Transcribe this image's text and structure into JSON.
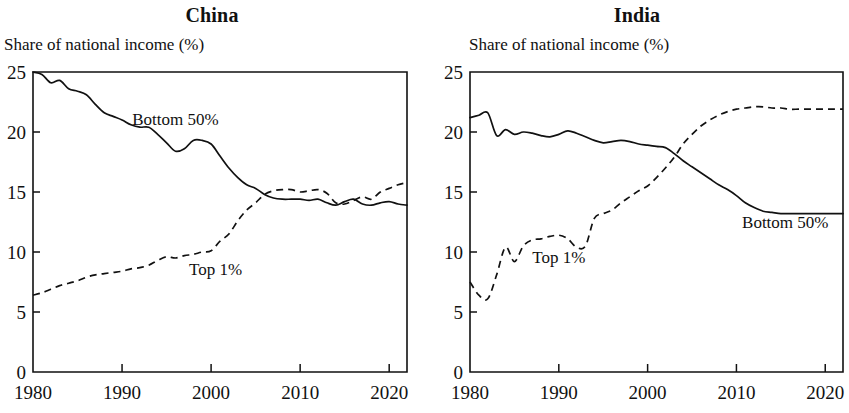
{
  "figure": {
    "axis_caption": "Share of national income (%)",
    "ink_color": "#111111",
    "background_color": "#ffffff"
  },
  "panels": [
    {
      "key": "china",
      "title": "China",
      "axis_caption": "Share of national income (%)",
      "bottom50_label": "Bottom 50%",
      "top1_label": "Top 1%"
    },
    {
      "key": "india",
      "title": "India",
      "axis_caption": "Share of national income (%)",
      "bottom50_label": "Bottom 50%",
      "top1_label": "Top 1%"
    }
  ],
  "axes": {
    "y_ticks": [
      "0",
      "5",
      "10",
      "15",
      "20",
      "25"
    ],
    "x_ticks": [
      "1980",
      "1990",
      "2000",
      "2010",
      "2020"
    ]
  },
  "chart_data": [
    {
      "type": "line",
      "title": "China",
      "xlabel": "",
      "ylabel": "Share of national income (%)",
      "xlim": [
        1980,
        2022
      ],
      "ylim": [
        0,
        25
      ],
      "y_ticks": [
        0,
        5,
        10,
        15,
        20,
        25
      ],
      "x_ticks": [
        1980,
        1990,
        2000,
        2010,
        2020
      ],
      "grid": false,
      "legend": "inline annotations",
      "x": [
        1980,
        1981,
        1982,
        1983,
        1984,
        1985,
        1986,
        1987,
        1988,
        1989,
        1990,
        1991,
        1992,
        1993,
        1994,
        1995,
        1996,
        1997,
        1998,
        1999,
        2000,
        2001,
        2002,
        2003,
        2004,
        2005,
        2006,
        2007,
        2008,
        2009,
        2010,
        2011,
        2012,
        2013,
        2014,
        2015,
        2016,
        2017,
        2018,
        2019,
        2020,
        2021,
        2022
      ],
      "series": [
        {
          "name": "Bottom 50%",
          "style": "solid",
          "values": [
            25.0,
            24.8,
            24.1,
            24.3,
            23.6,
            23.4,
            23.1,
            22.3,
            21.6,
            21.3,
            21.0,
            20.6,
            20.4,
            20.4,
            19.8,
            19.1,
            18.4,
            18.6,
            19.3,
            19.3,
            19.0,
            18.0,
            17.0,
            16.2,
            15.6,
            15.3,
            14.8,
            14.5,
            14.4,
            14.4,
            14.4,
            14.3,
            14.4,
            14.1,
            13.9,
            14.2,
            14.4,
            14.0,
            13.9,
            14.1,
            14.2,
            14.0,
            13.9
          ]
        },
        {
          "name": "Top 1%",
          "style": "dashed",
          "values": [
            6.4,
            6.6,
            6.9,
            7.2,
            7.4,
            7.6,
            7.9,
            8.1,
            8.2,
            8.3,
            8.4,
            8.6,
            8.7,
            8.9,
            9.3,
            9.6,
            9.5,
            9.7,
            9.8,
            10.0,
            10.1,
            10.9,
            11.5,
            12.6,
            13.5,
            14.1,
            14.8,
            15.1,
            15.2,
            15.2,
            15.0,
            15.1,
            15.2,
            14.9,
            14.1,
            14.0,
            14.3,
            14.6,
            14.4,
            15.0,
            15.3,
            15.6,
            15.8
          ]
        }
      ]
    },
    {
      "type": "line",
      "title": "India",
      "xlabel": "",
      "ylabel": "Share of national income (%)",
      "xlim": [
        1980,
        2022
      ],
      "ylim": [
        0,
        25
      ],
      "y_ticks": [
        0,
        5,
        10,
        15,
        20,
        25
      ],
      "x_ticks": [
        1980,
        1990,
        2000,
        2010,
        2020
      ],
      "grid": false,
      "legend": "inline annotations",
      "x": [
        1980,
        1981,
        1982,
        1983,
        1984,
        1985,
        1986,
        1987,
        1988,
        1989,
        1990,
        1991,
        1992,
        1993,
        1994,
        1995,
        1996,
        1997,
        1998,
        1999,
        2000,
        2001,
        2002,
        2003,
        2004,
        2005,
        2006,
        2007,
        2008,
        2009,
        2010,
        2011,
        2012,
        2013,
        2014,
        2015,
        2016,
        2017,
        2018,
        2019,
        2020,
        2021,
        2022
      ],
      "series": [
        {
          "name": "Bottom 50%",
          "style": "solid",
          "values": [
            21.2,
            21.4,
            21.6,
            19.7,
            20.2,
            19.8,
            20.0,
            19.9,
            19.7,
            19.6,
            19.8,
            20.1,
            19.9,
            19.6,
            19.3,
            19.1,
            19.2,
            19.3,
            19.2,
            19.0,
            18.9,
            18.8,
            18.7,
            18.2,
            17.6,
            17.1,
            16.6,
            16.1,
            15.6,
            15.2,
            14.7,
            14.1,
            13.7,
            13.4,
            13.3,
            13.2,
            13.2,
            13.2,
            13.2,
            13.2,
            13.2,
            13.2,
            13.2
          ]
        },
        {
          "name": "Top 1%",
          "style": "dashed",
          "values": [
            7.5,
            6.4,
            6.1,
            8.1,
            10.4,
            9.2,
            10.5,
            11.0,
            11.1,
            11.3,
            11.4,
            11.1,
            10.4,
            10.5,
            12.8,
            13.2,
            13.5,
            14.1,
            14.6,
            15.1,
            15.5,
            16.2,
            17.0,
            17.9,
            19.0,
            19.8,
            20.5,
            21.0,
            21.4,
            21.7,
            21.9,
            22.0,
            22.1,
            22.1,
            22.0,
            22.0,
            21.9,
            21.9,
            21.9,
            21.9,
            21.9,
            21.9,
            21.9
          ]
        }
      ]
    }
  ]
}
